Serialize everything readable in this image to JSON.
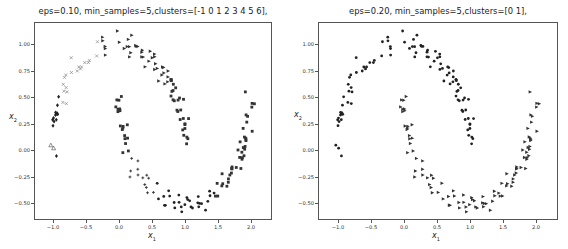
{
  "chart_data": [
    {
      "type": "scatter",
      "title": "eps=0.10, min_samples=5,clusters=[-1  0  1  2  3  4  5  6],",
      "xlabel": "x1",
      "ylabel": "x2",
      "xlim": [
        -1.2,
        2.2
      ],
      "ylim": [
        -0.65,
        1.2
      ],
      "xticks": [
        "−1.0",
        "−0.5",
        "0.0",
        "0.5",
        "1.0",
        "1.5",
        "2.0"
      ],
      "yticks": [
        "1.00",
        "0.75",
        "0.50",
        "0.25",
        "0.00",
        "−0.25",
        "−0.50"
      ],
      "grid": false,
      "legend": null,
      "dataset": "two moons, n≈200, noise≈0.05",
      "clusters": [
        {
          "label": -1,
          "marker": "triangle-open",
          "color": "#444444",
          "region": "scattered outliers"
        },
        {
          "label": 0,
          "marker": "x",
          "color": "#888888",
          "region": "upper moon left arc (x −1.0 to −0.3)"
        },
        {
          "label": 1,
          "marker": "diamond",
          "color": "#222222",
          "region": "upper moon left tip (x ≈ −1.0 to −0.9, y ≈ 0.0–0.6)"
        },
        {
          "label": 2,
          "marker": "triangle-right",
          "color": "#333333",
          "region": "upper moon top arc (x 0.0 to 1.0)"
        },
        {
          "label": 3,
          "marker": "square",
          "color": "#333333",
          "region": "upper moon right descent & lower moon left tip"
        },
        {
          "label": 4,
          "marker": "plus",
          "color": "#333333",
          "region": "lower moon bottom-left (x 0.2 to 0.6)"
        },
        {
          "label": 5,
          "marker": "circle",
          "color": "#222222",
          "region": "lower moon bottom (x 0.6 to 1.4)"
        },
        {
          "label": 6,
          "marker": "square",
          "color": "#333333",
          "region": "lower moon right arc (x 1.5 to 2.0)"
        }
      ]
    },
    {
      "type": "scatter",
      "title": "eps=0.20, min_samples=5,clusters=[0 1],",
      "xlabel": "x1",
      "ylabel": "x2",
      "xlim": [
        -1.2,
        2.2
      ],
      "ylim": [
        -0.65,
        1.2
      ],
      "xticks": [
        "−1.0",
        "−0.5",
        "0.0",
        "0.5",
        "1.0",
        "1.5",
        "2.0"
      ],
      "yticks": [
        "1.00",
        "0.75",
        "0.50",
        "0.25",
        "0.00",
        "−0.25",
        "−0.50"
      ],
      "grid": false,
      "legend": null,
      "dataset": "two moons, n≈200, noise≈0.05",
      "clusters": [
        {
          "label": 0,
          "marker": "circle",
          "color": "#222222",
          "region": "upper moon"
        },
        {
          "label": 1,
          "marker": "triangle-right",
          "color": "#333333",
          "region": "lower moon"
        }
      ]
    }
  ],
  "plots": {
    "left": {
      "title": "eps=0.10, min_samples=5,clusters=[-1  0  1  2  3  4  5  6],",
      "xlabel_main": "x",
      "xlabel_sub": "1",
      "ylabel_main": "x",
      "ylabel_sub": "2"
    },
    "right": {
      "title": "eps=0.20, min_samples=5,clusters=[0 1],",
      "xlabel_main": "x",
      "xlabel_sub": "1",
      "ylabel_main": "x",
      "ylabel_sub": "2"
    }
  }
}
